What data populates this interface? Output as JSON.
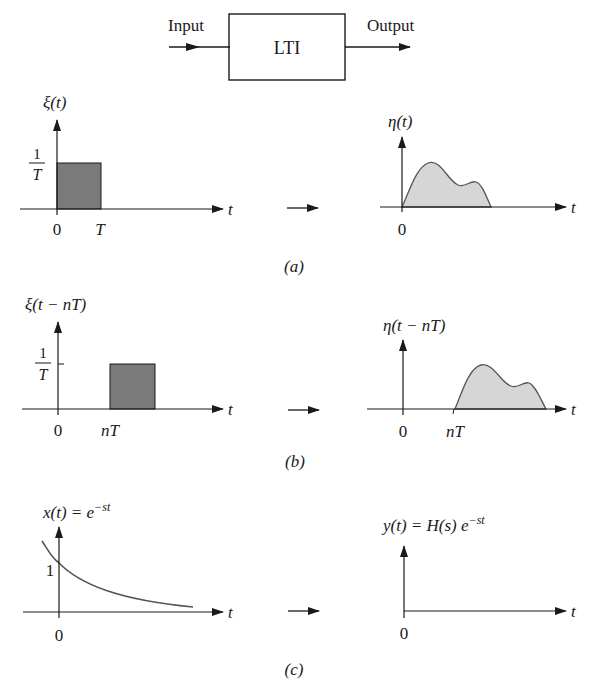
{
  "block_diagram": {
    "input_label": "Input",
    "system_label": "LTI",
    "output_label": "Output"
  },
  "panels": [
    {
      "caption": "(a)",
      "input": {
        "ylabel": "ξ(t)",
        "level_num": "1",
        "level_den": "T",
        "ticks": [
          "0",
          "T"
        ],
        "xlabel": "t"
      },
      "output": {
        "ylabel": "η(t)",
        "ticks": [
          "0"
        ],
        "xlabel": "t"
      }
    },
    {
      "caption": "(b)",
      "input": {
        "ylabel": "ξ(t − nT)",
        "level_num": "1",
        "level_den": "T",
        "ticks": [
          "0",
          "nT"
        ],
        "xlabel": "t"
      },
      "output": {
        "ylabel": "η(t − nT)",
        "ticks": [
          "0",
          "nT"
        ],
        "xlabel": "t"
      }
    },
    {
      "caption": "(c)",
      "input": {
        "ylabel_main": "x(t) = e",
        "ylabel_sup": "−st",
        "level": "1",
        "ticks": [
          "0"
        ],
        "xlabel": "t"
      },
      "output": {
        "ylabel_main": "y(t) = H(s) e",
        "ylabel_sup": "−st",
        "ticks": [
          "0"
        ],
        "xlabel": "t"
      }
    }
  ],
  "colors": {
    "ink": "#1a1a1a",
    "pulse_fill": "#7a7a7a",
    "response_fill": "#d6d6d6",
    "curve": "#555555"
  }
}
